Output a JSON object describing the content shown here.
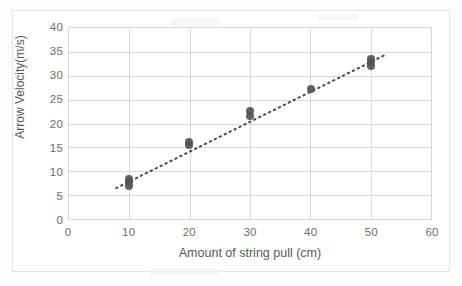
{
  "chart_data": {
    "type": "scatter",
    "title": "",
    "xlabel": "Amount of string pull (cm)",
    "ylabel": "Arrow Velocity(m/s)",
    "xlim": [
      0,
      60
    ],
    "ylim": [
      0,
      40
    ],
    "xticks": [
      0,
      10,
      20,
      30,
      40,
      50,
      60
    ],
    "yticks": [
      0,
      5,
      10,
      15,
      20,
      25,
      30,
      35,
      40
    ],
    "grid": true,
    "legend": false,
    "x": [
      10,
      10,
      10,
      20,
      20,
      30,
      30,
      40,
      50,
      50,
      50
    ],
    "y": [
      7.0,
      7.8,
      8.5,
      15.5,
      16.2,
      21.6,
      22.6,
      27.1,
      31.9,
      32.7,
      33.4
    ],
    "series": [
      {
        "name": "Arrow velocity vs string pull",
        "points": [
          {
            "x": 10,
            "y": 7.0
          },
          {
            "x": 10,
            "y": 7.8
          },
          {
            "x": 10,
            "y": 8.5
          },
          {
            "x": 20,
            "y": 15.5
          },
          {
            "x": 20,
            "y": 16.2
          },
          {
            "x": 30,
            "y": 21.6
          },
          {
            "x": 30,
            "y": 22.6
          },
          {
            "x": 40,
            "y": 27.1
          },
          {
            "x": 50,
            "y": 31.9
          },
          {
            "x": 50,
            "y": 32.7
          },
          {
            "x": 50,
            "y": 33.4
          }
        ]
      }
    ],
    "trendline": {
      "style": "dotted",
      "color": "#4a4a4a",
      "x0": 10,
      "y0": 7.9,
      "x1": 50,
      "y1": 32.8
    },
    "marker_color": "#545454",
    "grid_color": "#d9d9d9",
    "axis_text_color": "#6e6e6e"
  },
  "axis": {
    "y_labels": [
      "40",
      "35",
      "30",
      "25",
      "20",
      "15",
      "10",
      "5",
      "0"
    ],
    "x_labels": [
      "0",
      "10",
      "20",
      "30",
      "40",
      "50",
      "60"
    ],
    "y_title": "Arrow Velocity(m/s)",
    "x_title": "Amount of string pull (cm)"
  }
}
